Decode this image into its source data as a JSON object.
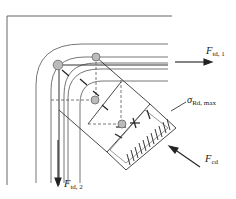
{
  "diagram": {
    "labels": {
      "f_td1": {
        "main": "F",
        "sub": "td, 1"
      },
      "f_td2": {
        "main": "F",
        "sub": "td, 2"
      },
      "f_cd": {
        "main": "F",
        "sub": "cd"
      },
      "sigma_rd_max": {
        "main": "σ",
        "sub": "Rd, max"
      }
    },
    "colors": {
      "line": "#555555",
      "strut": "#333333",
      "node_fill": "#bbbbbb",
      "node_stroke": "#666666",
      "arrow": "#222222"
    }
  }
}
